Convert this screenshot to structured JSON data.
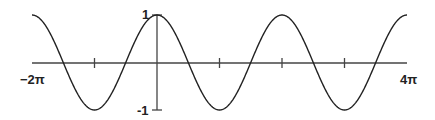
{
  "chart_data": {
    "type": "line",
    "title": "",
    "function": "cos(x)",
    "xlabel": "",
    "ylabel": "",
    "xlim": [
      "-2π",
      "4π"
    ],
    "ylim": [
      -1,
      1
    ],
    "x_tick_positions": [
      "-π",
      "π",
      "2π",
      "3π"
    ],
    "x_tick_labels": {
      "left": "−2π",
      "right": "4π"
    },
    "y_tick_labels": {
      "top": "1",
      "bottom": "-1"
    },
    "grid": false,
    "legend": null,
    "series": [
      {
        "name": "cos(x)",
        "x": [
          "-2π",
          "-3π/2",
          "-π",
          "-π/2",
          "0",
          "π/2",
          "π",
          "3π/2",
          "2π",
          "5π/2",
          "3π",
          "7π/2",
          "4π"
        ],
        "values": [
          1,
          0,
          -1,
          0,
          1,
          0,
          -1,
          0,
          1,
          0,
          -1,
          0,
          1
        ]
      }
    ],
    "colors": {
      "curve": "#222222",
      "axis": "#444444"
    }
  },
  "labels": {
    "x_min": "−2π",
    "x_max": "4π",
    "y_max": "1",
    "y_min": "-1"
  }
}
